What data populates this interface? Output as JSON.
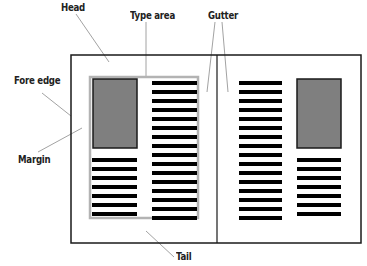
{
  "labels": {
    "head": "Head",
    "type_area": "Type area",
    "gutter": "Gutter",
    "fore_edge": "Fore edge",
    "margin": "Margin",
    "tail": "Tail"
  },
  "colors": {
    "frame": "#1a1a1a",
    "image_fill": "#7f7f7f",
    "type_area_border": "#b3b3b3",
    "text_line": "#000000",
    "leader": "#8a8a8a"
  },
  "layout": {
    "spread": {
      "x": 71,
      "y": 55,
      "w": 290,
      "h": 188
    },
    "spine_x": 217,
    "type_area": {
      "x": 90,
      "y": 77,
      "w": 108,
      "h": 141
    },
    "line_pitch": 9,
    "line_thickness": 4
  },
  "pages": [
    {
      "name": "left-page",
      "image": {
        "x": 93,
        "y": 79,
        "w": 44,
        "h": 69
      },
      "columns": [
        {
          "x": 92,
          "w": 45,
          "y_start": 158,
          "count": 7
        },
        {
          "x": 152,
          "w": 45,
          "y_start": 81,
          "count": 16
        }
      ]
    },
    {
      "name": "right-page",
      "image": {
        "x": 297,
        "y": 79,
        "w": 44,
        "h": 69
      },
      "columns": [
        {
          "x": 239,
          "w": 43,
          "y_start": 81,
          "count": 16
        },
        {
          "x": 297,
          "w": 44,
          "y_start": 158,
          "count": 7
        }
      ]
    }
  ]
}
